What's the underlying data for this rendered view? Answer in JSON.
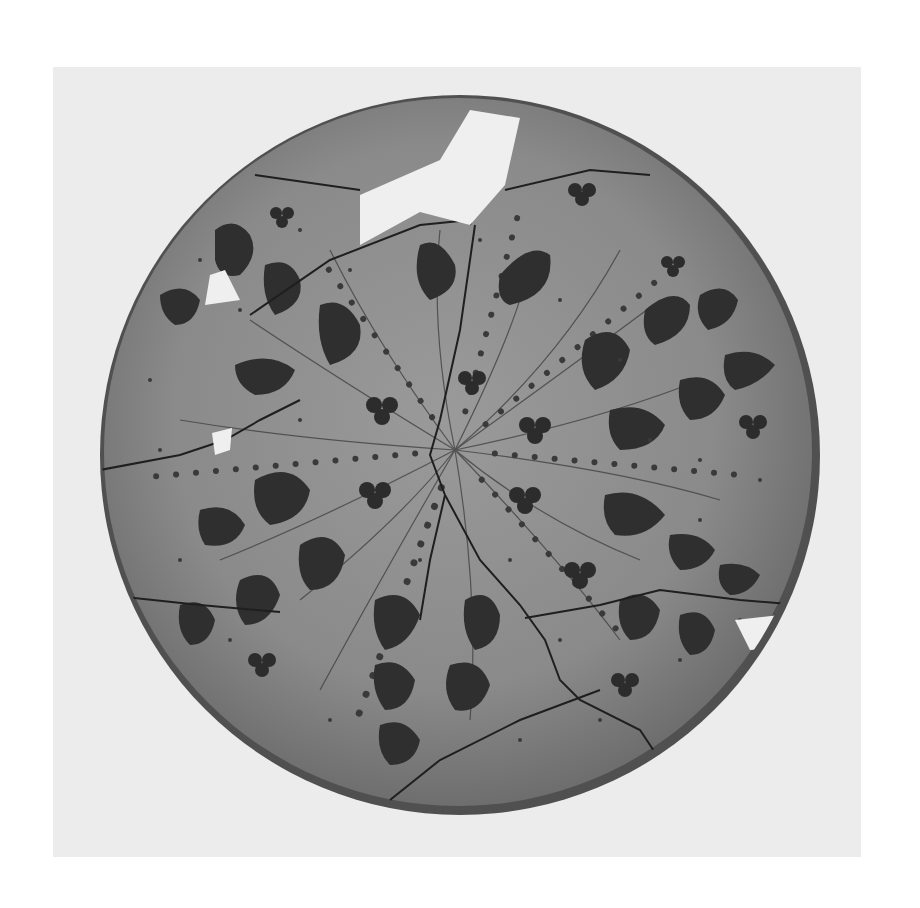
{
  "image": {
    "subject": "Restored ceramic plate with painted leaf and trefoil motifs",
    "style": "black-and-white photograph",
    "colors": {
      "page_background": "#ffffff",
      "photo_background": "#ececec",
      "plate_surface": "#8c8c8c",
      "plate_rim": "#4a4a4a",
      "motif_dark": "#2e2e2e",
      "missing_piece": "#efefef"
    }
  }
}
